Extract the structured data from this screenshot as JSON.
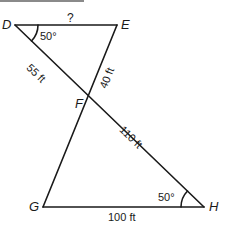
{
  "diagram": {
    "type": "geometry",
    "vertices": {
      "D": "D",
      "E": "E",
      "F": "F",
      "G": "G",
      "H": "H"
    },
    "segments": [
      {
        "from": "D",
        "to": "E",
        "label": "?"
      },
      {
        "from": "D",
        "to": "F",
        "label": "55 ft"
      },
      {
        "from": "E",
        "to": "F",
        "label": "40 ft"
      },
      {
        "from": "F",
        "to": "H",
        "label": "110 ft"
      },
      {
        "from": "G",
        "to": "H",
        "label": "100 ft"
      },
      {
        "from": "F",
        "to": "G",
        "label": ""
      }
    ],
    "angles": [
      {
        "vertex": "D",
        "label": "50°"
      },
      {
        "vertex": "H",
        "label": "50°"
      }
    ],
    "colors": {
      "line": "#1a1a1a",
      "background": "#ffffff",
      "top_rule": "#8a8a8a"
    }
  }
}
